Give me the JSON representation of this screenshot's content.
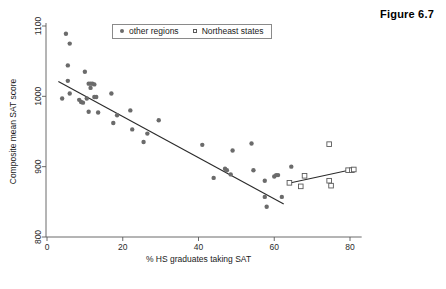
{
  "figure": {
    "caption": "Figure 6.7"
  },
  "legend": {
    "position": "top-center-inside",
    "entries": [
      {
        "label": "other regions",
        "marker": "filled-circle",
        "color": "#6b6b6b"
      },
      {
        "label": "Northeast states",
        "marker": "open-square",
        "color": "#5a5a5a"
      }
    ]
  },
  "chart_data": {
    "type": "scatter",
    "title": "Figure 6.7",
    "xlabel": "% HS graduates taking SAT",
    "ylabel": "Composite mean SAT score",
    "xlim": [
      -2,
      84
    ],
    "ylim": [
      790,
      1105
    ],
    "xticks": [
      0,
      20,
      40,
      60,
      80
    ],
    "yticks": [
      800,
      900,
      1000,
      1100
    ],
    "grid": false,
    "series": [
      {
        "name": "other regions",
        "marker": "filled-circle",
        "color": "#6b6b6b",
        "points": [
          [
            4.0,
            997
          ],
          [
            5.0,
            1089
          ],
          [
            5.5,
            1044
          ],
          [
            5.5,
            1022
          ],
          [
            6.0,
            1075
          ],
          [
            6.0,
            1004
          ],
          [
            8.5,
            995
          ],
          [
            9.0,
            992
          ],
          [
            9.5,
            991
          ],
          [
            10.0,
            1035
          ],
          [
            10.5,
            997
          ],
          [
            11.0,
            1018
          ],
          [
            11.5,
            1018
          ],
          [
            12.0,
            1018
          ],
          [
            12.5,
            1017
          ],
          [
            11.5,
            1012
          ],
          [
            11.0,
            978
          ],
          [
            12.5,
            999
          ],
          [
            13.0,
            999
          ],
          [
            13.5,
            977
          ],
          [
            17.0,
            1004
          ],
          [
            17.5,
            962
          ],
          [
            18.5,
            973
          ],
          [
            22.0,
            980
          ],
          [
            22.5,
            953
          ],
          [
            25.5,
            935
          ],
          [
            26.5,
            947
          ],
          [
            29.5,
            966
          ],
          [
            41.0,
            931
          ],
          [
            44.0,
            884
          ],
          [
            47.0,
            897
          ],
          [
            47.5,
            895
          ],
          [
            48.5,
            889
          ],
          [
            49.0,
            923
          ],
          [
            54.0,
            933
          ],
          [
            54.5,
            895
          ],
          [
            57.5,
            880
          ],
          [
            57.5,
            857
          ],
          [
            58.0,
            843
          ],
          [
            60.0,
            886
          ],
          [
            60.5,
            888
          ],
          [
            61.0,
            888
          ],
          [
            62.0,
            857
          ],
          [
            64.5,
            900
          ]
        ]
      },
      {
        "name": "Northeast states",
        "marker": "open-square",
        "color": "#5a5a5a",
        "points": [
          [
            64.0,
            877
          ],
          [
            67.0,
            872
          ],
          [
            68.0,
            887
          ],
          [
            74.5,
            932
          ],
          [
            74.5,
            880
          ],
          [
            75.0,
            873
          ],
          [
            79.5,
            895
          ],
          [
            80.5,
            895
          ],
          [
            81.0,
            896
          ]
        ]
      }
    ],
    "fit_lines": [
      {
        "name": "other-regions-fit",
        "x_start": 3.0,
        "y_start": 1021,
        "x_end": 62.5,
        "y_end": 847
      },
      {
        "name": "northeast-states-fit",
        "x_start": 63.5,
        "y_start": 876,
        "x_end": 81.5,
        "y_end": 897
      }
    ]
  }
}
